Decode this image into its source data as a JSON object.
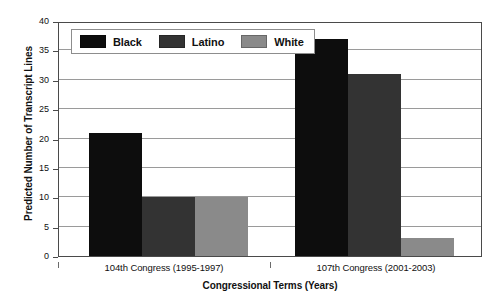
{
  "chart_data": {
    "type": "bar",
    "title": "",
    "xlabel": "Congressional Terms (Years)",
    "ylabel": "Predicted Number of Transcript Lines",
    "categories": [
      "104th Congress (1995-1997)",
      "107th Congress (2001-2003)"
    ],
    "series": [
      {
        "name": "Black",
        "color": "#0d0d0d",
        "values": [
          21,
          37
        ]
      },
      {
        "name": "Latino",
        "color": "#333333",
        "values": [
          10,
          31
        ]
      },
      {
        "name": "White",
        "color": "#8a8a8a",
        "values": [
          10,
          3
        ]
      }
    ],
    "ylim": [
      0,
      40
    ],
    "yticks": [
      0,
      5,
      10,
      15,
      20,
      25,
      30,
      35,
      40
    ],
    "ytick_labels": [
      "0",
      "5",
      "10",
      "15",
      "20",
      "25",
      "30",
      "35",
      "40"
    ],
    "grid": true,
    "legend_position": "top-left-inside"
  },
  "legend": {
    "items": [
      {
        "label": "Black",
        "color": "#0d0d0d"
      },
      {
        "label": "Latino",
        "color": "#333333"
      },
      {
        "label": "White",
        "color": "#8a8a8a"
      }
    ]
  },
  "axes": {
    "y_title": "Predicted Number of Transcript Lines",
    "x_title": "Congressional Terms (Years)"
  },
  "colors": {
    "frame": "#4a4a4a",
    "gridline": "#9a9a9a",
    "background": "#ffffff",
    "text": "#111111"
  }
}
